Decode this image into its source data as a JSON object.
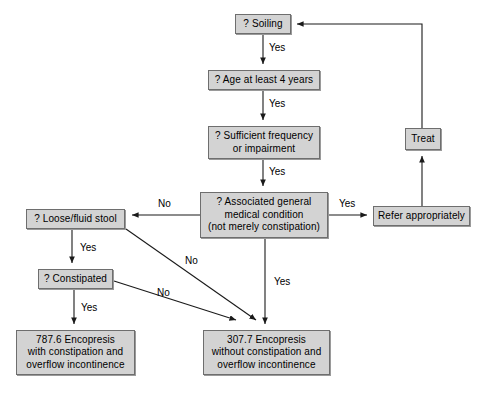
{
  "diagram": {
    "colors": {
      "node_fill": "#d3d3d3",
      "node_border": "#6e6e6e",
      "edge": "#1a1a1a",
      "background": "#ffffff",
      "text": "#000000"
    },
    "nodes": [
      {
        "id": "soiling",
        "label": "? Soiling",
        "x": 235,
        "y": 14,
        "w": 56,
        "h": 20,
        "kind": "decision"
      },
      {
        "id": "age",
        "label": "? Age at least 4 years",
        "x": 208,
        "y": 70,
        "w": 112,
        "h": 20,
        "kind": "decision"
      },
      {
        "id": "frequency",
        "label": "? Sufficient frequency\nor impairment",
        "x": 208,
        "y": 126,
        "w": 112,
        "h": 33,
        "kind": "decision"
      },
      {
        "id": "medical",
        "label": "? Associated general\nmedical condition\n(not merely constipation)",
        "x": 200,
        "y": 192,
        "w": 128,
        "h": 46,
        "kind": "decision"
      },
      {
        "id": "loose",
        "label": "? Loose/fluid stool",
        "x": 26,
        "y": 209,
        "w": 99,
        "h": 20,
        "kind": "decision"
      },
      {
        "id": "constipated",
        "label": "? Constipated",
        "x": 38,
        "y": 269,
        "w": 75,
        "h": 20,
        "kind": "decision"
      },
      {
        "id": "treat",
        "label": "Treat",
        "x": 405,
        "y": 128,
        "w": 36,
        "h": 22,
        "kind": "action"
      },
      {
        "id": "refer",
        "label": "Refer appropriately",
        "x": 373,
        "y": 206,
        "w": 97,
        "h": 20,
        "kind": "action"
      },
      {
        "id": "dx_7876",
        "label": "787.6 Encopresis\nwith constipation and\noverflow incontinence",
        "x": 16,
        "y": 330,
        "w": 119,
        "h": 45,
        "kind": "outcome"
      },
      {
        "id": "dx_3077",
        "label": "307.7 Encopresis\nwithout constipation and\noverflow incontinence",
        "x": 203,
        "y": 330,
        "w": 127,
        "h": 45,
        "kind": "outcome"
      }
    ],
    "edge_labels": [
      {
        "id": "yes-soiling-age",
        "text": "Yes",
        "x": 269,
        "y": 42
      },
      {
        "id": "yes-age-frequency",
        "text": "Yes",
        "x": 269,
        "y": 98
      },
      {
        "id": "yes-frequency-medical",
        "text": "Yes",
        "x": 269,
        "y": 166
      },
      {
        "id": "no-medical-loose",
        "text": "No",
        "x": 158,
        "y": 198
      },
      {
        "id": "yes-medical-refer",
        "text": "Yes",
        "x": 339,
        "y": 198
      },
      {
        "id": "yes-loose-constipated",
        "text": "Yes",
        "x": 80,
        "y": 242
      },
      {
        "id": "no-loose-dx3077",
        "text": "No",
        "x": 185,
        "y": 258
      },
      {
        "id": "no-constipated-dx3077",
        "text": "No",
        "x": 157,
        "y": 288
      },
      {
        "id": "yes-constipated-dx7876",
        "text": "Yes",
        "x": 81,
        "y": 304
      },
      {
        "id": "yes-medical-dx3077",
        "text": "Yes",
        "x": 274,
        "y": 278
      }
    ],
    "edges": [
      {
        "id": "soiling-to-age",
        "from": "soiling",
        "to": "age",
        "answer": "Yes"
      },
      {
        "id": "age-to-frequency",
        "from": "age",
        "to": "frequency",
        "answer": "Yes"
      },
      {
        "id": "frequency-to-medical",
        "from": "frequency",
        "to": "medical",
        "answer": "Yes"
      },
      {
        "id": "medical-to-loose",
        "from": "medical",
        "to": "loose",
        "answer": "No"
      },
      {
        "id": "medical-to-refer",
        "from": "medical",
        "to": "refer",
        "answer": "Yes"
      },
      {
        "id": "refer-to-treat",
        "from": "refer",
        "to": "treat",
        "answer": ""
      },
      {
        "id": "treat-to-soiling",
        "from": "treat",
        "to": "soiling",
        "answer": ""
      },
      {
        "id": "loose-to-constipated",
        "from": "loose",
        "to": "constipated",
        "answer": "Yes"
      },
      {
        "id": "loose-to-dx3077",
        "from": "loose",
        "to": "dx_3077",
        "answer": "No"
      },
      {
        "id": "constipated-to-dx7876",
        "from": "constipated",
        "to": "dx_7876",
        "answer": "Yes"
      },
      {
        "id": "constipated-to-dx3077",
        "from": "constipated",
        "to": "dx_3077",
        "answer": "No"
      },
      {
        "id": "medical-to-dx3077",
        "from": "medical",
        "to": "dx_3077",
        "answer": "Yes"
      }
    ]
  }
}
